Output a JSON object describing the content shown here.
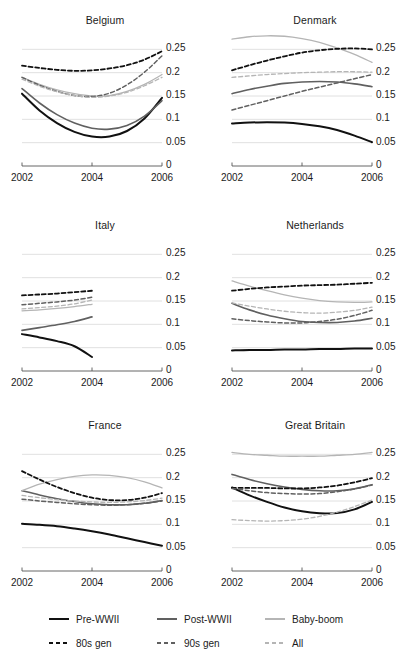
{
  "figure": {
    "panel_titles": [
      "Belgium",
      "Denmark",
      "Italy",
      "Netherlands",
      "France",
      "Great Britain"
    ]
  },
  "axis": {
    "y_ticks": [
      "0.25",
      "0.2",
      "0.15",
      "0.1",
      "0.05",
      "0"
    ],
    "x_ticks": [
      "2002",
      "2004",
      "2006"
    ]
  },
  "legend": {
    "row1": [
      {
        "label": "Pre-WWII",
        "style": "solid",
        "color": "#111111"
      },
      {
        "label": "Post-WWII",
        "style": "solid",
        "color": "#606060"
      },
      {
        "label": "Baby-boom",
        "style": "solid",
        "color": "#b5b5b5"
      }
    ],
    "row2": [
      {
        "label": "80s gen",
        "style": "dashed",
        "color": "#111111"
      },
      {
        "label": "90s gen",
        "style": "dashed",
        "color": "#606060"
      },
      {
        "label": "All",
        "style": "dashed",
        "color": "#b5b5b5"
      }
    ]
  },
  "colors": {
    "pre_wwii": "#111111",
    "post_wwii": "#606060",
    "baby_boom": "#b5b5b5",
    "gen80s": "#111111",
    "gen90s": "#606060",
    "all": "#b5b5b5",
    "gridline": "#d8d8d8",
    "axis": "#555555"
  },
  "chart_data": {
    "type": "line",
    "title": "",
    "xlabel": "",
    "ylabel": "",
    "xlim": [
      2002,
      2006
    ],
    "ylim": [
      0,
      0.27
    ],
    "grid": "horizontal",
    "legend_position": "bottom",
    "x": [
      2002,
      2002.5,
      2003,
      2003.5,
      2004,
      2004.5,
      2005,
      2005.5,
      2006
    ],
    "series_styles": {
      "Pre-WWII": {
        "style": "solid",
        "color": "#111111",
        "width": 2.0
      },
      "Post-WWII": {
        "style": "solid",
        "color": "#606060",
        "width": 1.6
      },
      "Baby-boom": {
        "style": "solid",
        "color": "#b5b5b5",
        "width": 1.3
      },
      "80s gen": {
        "style": "dashed",
        "color": "#111111",
        "width": 1.8
      },
      "90s gen": {
        "style": "dashed",
        "color": "#606060",
        "width": 1.5
      },
      "All": {
        "style": "dashed",
        "color": "#b5b5b5",
        "width": 1.3
      }
    },
    "panels": [
      {
        "name": "Belgium",
        "series": [
          {
            "name": "Pre-WWII",
            "values": [
              0.155,
              0.119,
              0.092,
              0.073,
              0.063,
              0.063,
              0.075,
              0.102,
              0.146
            ]
          },
          {
            "name": "Post-WWII",
            "values": [
              0.166,
              0.135,
              0.11,
              0.092,
              0.081,
              0.079,
              0.087,
              0.107,
              0.14
            ]
          },
          {
            "name": "Baby-boom",
            "values": [
              0.19,
              0.175,
              0.163,
              0.155,
              0.15,
              0.151,
              0.16,
              0.175,
              0.196
            ]
          },
          {
            "name": "80s gen",
            "values": [
              0.215,
              0.21,
              0.206,
              0.204,
              0.205,
              0.209,
              0.216,
              0.228,
              0.246
            ]
          },
          {
            "name": "90s gen",
            "values": [
              0.19,
              0.173,
              0.16,
              0.151,
              0.149,
              0.156,
              0.174,
              0.201,
              0.236
            ]
          },
          {
            "name": "All",
            "values": [
              0.186,
              0.171,
              0.159,
              0.151,
              0.147,
              0.15,
              0.158,
              0.172,
              0.19
            ]
          }
        ]
      },
      {
        "name": "Denmark",
        "series": [
          {
            "name": "Pre-WWII",
            "values": [
              0.091,
              0.093,
              0.094,
              0.093,
              0.09,
              0.085,
              0.077,
              0.065,
              0.051
            ]
          },
          {
            "name": "Post-WWII",
            "values": [
              0.155,
              0.164,
              0.171,
              0.177,
              0.18,
              0.181,
              0.18,
              0.176,
              0.17
            ]
          },
          {
            "name": "Baby-boom",
            "values": [
              0.272,
              0.277,
              0.279,
              0.278,
              0.273,
              0.265,
              0.253,
              0.239,
              0.222
            ]
          },
          {
            "name": "80s gen",
            "values": [
              0.205,
              0.216,
              0.226,
              0.235,
              0.243,
              0.248,
              0.251,
              0.252,
              0.25
            ]
          },
          {
            "name": "90s gen",
            "values": [
              0.12,
              0.13,
              0.14,
              0.15,
              0.16,
              0.169,
              0.178,
              0.187,
              0.196
            ]
          },
          {
            "name": "All",
            "values": [
              0.19,
              0.193,
              0.196,
              0.198,
              0.2,
              0.201,
              0.202,
              0.202,
              0.201
            ]
          }
        ]
      },
      {
        "name": "Italy",
        "x_end": 2004,
        "series": [
          {
            "name": "Pre-WWII",
            "values": [
              0.079,
              0.072,
              0.064,
              0.053,
              0.03
            ]
          },
          {
            "name": "Post-WWII",
            "values": [
              0.087,
              0.093,
              0.099,
              0.106,
              0.116
            ]
          },
          {
            "name": "Baby-boom",
            "values": [
              0.129,
              0.131,
              0.134,
              0.138,
              0.143
            ]
          },
          {
            "name": "80s gen",
            "values": [
              0.162,
              0.164,
              0.166,
              0.169,
              0.172
            ]
          },
          {
            "name": "90s gen",
            "values": [
              0.142,
              0.145,
              0.148,
              0.152,
              0.158
            ]
          },
          {
            "name": "All",
            "values": [
              0.133,
              0.136,
              0.139,
              0.144,
              0.152
            ]
          }
        ]
      },
      {
        "name": "Netherlands",
        "series": [
          {
            "name": "Pre-WWII",
            "values": [
              0.044,
              0.045,
              0.045,
              0.046,
              0.046,
              0.047,
              0.047,
              0.048,
              0.048
            ]
          },
          {
            "name": "Post-WWII",
            "values": [
              0.145,
              0.131,
              0.12,
              0.112,
              0.106,
              0.104,
              0.104,
              0.107,
              0.113
            ]
          },
          {
            "name": "Baby-boom",
            "values": [
              0.193,
              0.182,
              0.172,
              0.163,
              0.156,
              0.151,
              0.148,
              0.147,
              0.148
            ]
          },
          {
            "name": "80s gen",
            "values": [
              0.172,
              0.176,
              0.179,
              0.181,
              0.183,
              0.184,
              0.185,
              0.187,
              0.189
            ]
          },
          {
            "name": "90s gen",
            "values": [
              0.112,
              0.108,
              0.105,
              0.103,
              0.103,
              0.106,
              0.111,
              0.119,
              0.13
            ]
          },
          {
            "name": "All",
            "values": [
              0.146,
              0.139,
              0.133,
              0.128,
              0.125,
              0.124,
              0.126,
              0.13,
              0.137
            ]
          }
        ]
      },
      {
        "name": "France",
        "series": [
          {
            "name": "Pre-WWII",
            "values": [
              0.101,
              0.099,
              0.096,
              0.091,
              0.085,
              0.078,
              0.07,
              0.062,
              0.054
            ]
          },
          {
            "name": "Post-WWII",
            "values": [
              0.172,
              0.163,
              0.155,
              0.149,
              0.144,
              0.142,
              0.142,
              0.145,
              0.151
            ]
          },
          {
            "name": "Baby-boom",
            "values": [
              0.172,
              0.186,
              0.196,
              0.203,
              0.206,
              0.205,
              0.2,
              0.191,
              0.178
            ]
          },
          {
            "name": "80s gen",
            "values": [
              0.214,
              0.196,
              0.18,
              0.167,
              0.157,
              0.152,
              0.152,
              0.157,
              0.167
            ]
          },
          {
            "name": "90s gen",
            "values": [
              0.154,
              0.15,
              0.147,
              0.144,
              0.142,
              0.141,
              0.142,
              0.145,
              0.15
            ]
          },
          {
            "name": "All",
            "values": [
              0.162,
              0.157,
              0.153,
              0.15,
              0.148,
              0.147,
              0.148,
              0.151,
              0.156
            ]
          }
        ]
      },
      {
        "name": "Great Britain",
        "series": [
          {
            "name": "Pre-WWII",
            "values": [
              0.179,
              0.162,
              0.148,
              0.136,
              0.128,
              0.124,
              0.124,
              0.132,
              0.148
            ]
          },
          {
            "name": "Post-WWII",
            "values": [
              0.207,
              0.196,
              0.187,
              0.18,
              0.175,
              0.172,
              0.172,
              0.176,
              0.185
            ]
          },
          {
            "name": "Baby-boom",
            "values": [
              0.254,
              0.25,
              0.248,
              0.246,
              0.246,
              0.246,
              0.248,
              0.25,
              0.254
            ]
          },
          {
            "name": "80s gen",
            "values": [
              0.178,
              0.178,
              0.178,
              0.177,
              0.177,
              0.179,
              0.183,
              0.19,
              0.199
            ]
          },
          {
            "name": "90s gen",
            "values": [
              0.177,
              0.172,
              0.168,
              0.166,
              0.165,
              0.166,
              0.17,
              0.176,
              0.184
            ]
          },
          {
            "name": "All",
            "values": [
              0.11,
              0.108,
              0.107,
              0.108,
              0.111,
              0.117,
              0.126,
              0.138,
              0.152
            ]
          }
        ]
      }
    ]
  }
}
